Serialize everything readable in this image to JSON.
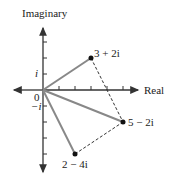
{
  "diagram": {
    "axes": {
      "x_label": "Real",
      "y_label": "Imaginary",
      "origin_label": "0",
      "tick_i": "i",
      "tick_neg_i": "−i"
    },
    "points": [
      {
        "label": "3 + 2i",
        "re": 3,
        "im": 2
      },
      {
        "label": "5 − 2i",
        "re": 5,
        "im": -2
      },
      {
        "label": "2 − 4i",
        "re": 2,
        "im": -4
      }
    ],
    "colors": {
      "vector": "#888888",
      "axis": "#333333",
      "dashed": "#333333"
    }
  }
}
